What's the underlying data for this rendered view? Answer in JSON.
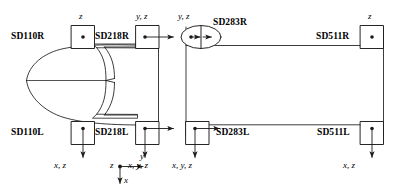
{
  "diagram": {
    "line_color": "#1a1a1a",
    "background_color": "#ffffff"
  },
  "stations": {
    "sd110r": {
      "name": "SD110R",
      "dof": "z",
      "dof_position": "above",
      "marker": "square-dot",
      "arrows": "none"
    },
    "sd110l": {
      "name": "SD110L",
      "dof": "x, z",
      "dof_position": "below",
      "marker": "square-dot",
      "arrows": "down"
    },
    "sd218r": {
      "name": "SD218R",
      "dof": "y, z",
      "dof_position": "above",
      "marker": "square-dot",
      "arrows": "right"
    },
    "sd218l": {
      "name": "SD218L",
      "dof": "x, y, z",
      "dof_position": "below",
      "marker": "square-dot",
      "arrows": "right, down"
    },
    "sd283r": {
      "name": "SD283R",
      "dof": "y, z",
      "dof_position": "above",
      "marker": "ellipse-split-dot-arrow",
      "arrows": "right"
    },
    "sd283l": {
      "name": "SD283L",
      "dof": "x, y, z",
      "dof_position": "below",
      "marker": "square-dot",
      "arrows": "right, down"
    },
    "sd511r": {
      "name": "SD511R",
      "dof": "z",
      "dof_position": "above",
      "marker": "square-dot",
      "arrows": "none"
    },
    "sd511l": {
      "name": "SD511L",
      "dof": "x, z",
      "dof_position": "below",
      "marker": "square-dot",
      "arrows": "down"
    }
  },
  "axis_triad": {
    "origin_label": "z",
    "horizontal_label": "y",
    "vertical_label": "x",
    "origin_marker": "dot",
    "horizontal_direction": "right",
    "vertical_direction": "down"
  }
}
